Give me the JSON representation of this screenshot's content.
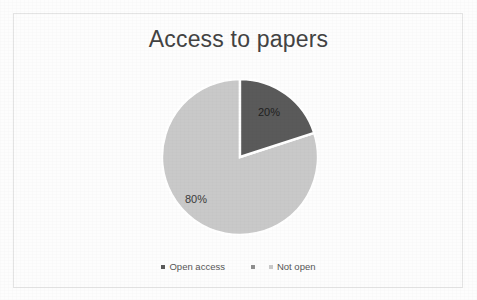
{
  "chart_data": {
    "type": "pie",
    "title": "Access to papers",
    "categories": [
      "Open access",
      "Not open"
    ],
    "values": [
      20,
      80
    ],
    "value_labels": [
      "20%",
      "80%"
    ],
    "colors": [
      "#5a5a5a",
      "#c9c9c9"
    ],
    "legend_position": "bottom",
    "start_angle_deg": 0,
    "direction": "clockwise",
    "xlabel": "",
    "ylabel": "",
    "grid": false,
    "background": "#ffffff",
    "border_color": "#e4e4e4",
    "title_color": "#434343",
    "legend_text_color": "#565656"
  },
  "legend": {
    "items": [
      {
        "label": "Open access",
        "marker_color": "#5a5a5a"
      },
      {
        "label": "Not open",
        "marker_color": "#c9c9c9"
      }
    ]
  }
}
